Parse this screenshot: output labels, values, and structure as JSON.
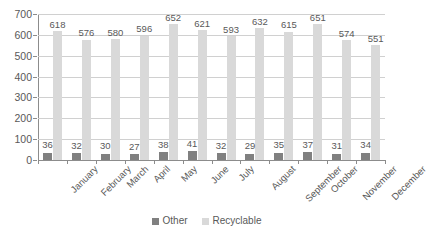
{
  "chart_data": {
    "type": "bar",
    "title": "",
    "subtitle": "",
    "xlabel": "",
    "ylabel": "",
    "ylim": [
      0,
      700
    ],
    "ytick_step": 100,
    "yticks": [
      "0",
      "100",
      "200",
      "300",
      "400",
      "500",
      "600",
      "700"
    ],
    "grid": true,
    "grid_axis": "y",
    "legend_position": "bottom-center",
    "categories": [
      "January",
      "February",
      "March",
      "April",
      "May",
      "June",
      "July",
      "August",
      "September",
      "October",
      "November",
      "December"
    ],
    "series": [
      {
        "name": "Other",
        "color": "#808080",
        "values": [
          36,
          32,
          30,
          27,
          38,
          41,
          32,
          29,
          35,
          37,
          31,
          34
        ]
      },
      {
        "name": "Recyclable",
        "color": "#d9d9d9",
        "values": [
          618,
          576,
          580,
          596,
          652,
          621,
          593,
          632,
          615,
          651,
          574,
          551
        ]
      }
    ]
  },
  "legend": {
    "items": [
      {
        "label": "Other",
        "color": "#808080"
      },
      {
        "label": "Recyclable",
        "color": "#d9d9d9"
      }
    ]
  },
  "colors": {
    "other": "#808080",
    "recyclable": "#d9d9d9",
    "gridline": "#d0d0d0",
    "axis": "#8c8c8c",
    "text": "#595959",
    "background": "#ffffff"
  }
}
